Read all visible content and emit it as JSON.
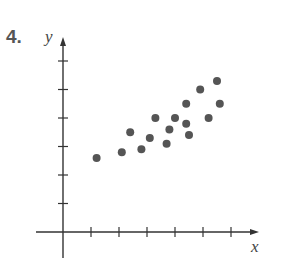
{
  "problem": {
    "number": "4."
  },
  "chart_data": {
    "type": "scatter",
    "title": "",
    "xlabel": "x",
    "ylabel": "y",
    "xlim": [
      -1,
      7
    ],
    "ylim": [
      -0.5,
      7
    ],
    "x_ticks": [
      1,
      2,
      3,
      4,
      5,
      6
    ],
    "y_ticks": [
      1,
      2,
      3,
      4,
      5,
      6
    ],
    "tick_labels_shown": false,
    "grid": false,
    "legend": null,
    "point_color": "#555555",
    "points": [
      {
        "x": 1.2,
        "y": 2.6
      },
      {
        "x": 2.1,
        "y": 2.8
      },
      {
        "x": 2.4,
        "y": 3.5
      },
      {
        "x": 2.8,
        "y": 2.9
      },
      {
        "x": 3.1,
        "y": 3.3
      },
      {
        "x": 3.3,
        "y": 4.0
      },
      {
        "x": 3.7,
        "y": 3.1
      },
      {
        "x": 3.8,
        "y": 3.6
      },
      {
        "x": 4.0,
        "y": 4.0
      },
      {
        "x": 4.4,
        "y": 3.8
      },
      {
        "x": 4.5,
        "y": 3.4
      },
      {
        "x": 4.4,
        "y": 4.5
      },
      {
        "x": 4.9,
        "y": 5.0
      },
      {
        "x": 5.2,
        "y": 4.0
      },
      {
        "x": 5.5,
        "y": 5.3
      },
      {
        "x": 5.6,
        "y": 4.5
      }
    ]
  }
}
